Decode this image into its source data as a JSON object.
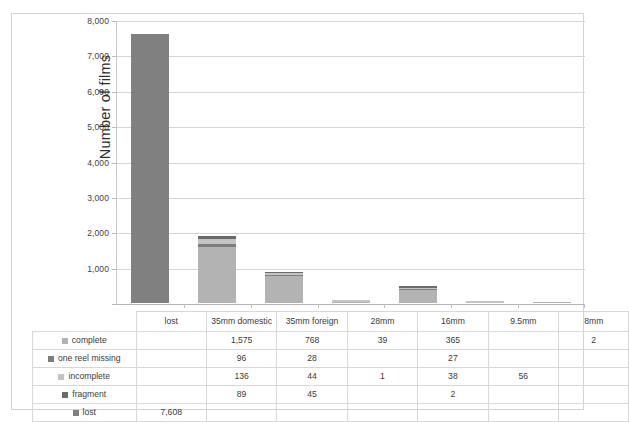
{
  "chart_data": {
    "type": "bar",
    "subtype": "stacked-column-with-data-table",
    "title": "",
    "xlabel": "",
    "ylabel": "Number of films",
    "ylim": [
      0,
      8000
    ],
    "ytick_labels": [
      "8,000",
      "7,000",
      "6,000",
      "5,000",
      "4,000",
      "3,000",
      "2,000",
      "1,000",
      ""
    ],
    "ytick_values": [
      8000,
      7000,
      6000,
      5000,
      4000,
      3000,
      2000,
      1000,
      0
    ],
    "grid": true,
    "legend_position": "data-table-row-headers",
    "categories": [
      "lost",
      "35mm domestic",
      "35mm foreign",
      "28mm",
      "16mm",
      "9.5mm",
      "8mm"
    ],
    "series": [
      {
        "name": "complete",
        "color": "#b3b3b3",
        "values": [
          null,
          1575,
          768,
          39,
          365,
          null,
          2
        ]
      },
      {
        "name": "one reel missing",
        "color": "#7d7d7d",
        "values": [
          null,
          96,
          28,
          null,
          27,
          null,
          null
        ]
      },
      {
        "name": "incomplete",
        "color": "#c4c4c4",
        "values": [
          null,
          136,
          44,
          1,
          38,
          56,
          null
        ]
      },
      {
        "name": "fragment",
        "color": "#6b6b6b",
        "values": [
          null,
          89,
          45,
          null,
          2,
          null,
          null
        ]
      },
      {
        "name": "lost",
        "color": "#808080",
        "values": [
          7608,
          null,
          null,
          null,
          null,
          null,
          null
        ]
      }
    ],
    "totals": [
      7608,
      1896,
      885,
      40,
      432,
      56,
      2
    ]
  },
  "table": {
    "corner_label": "",
    "column_headers": [
      "lost",
      "35mm domestic",
      "35mm foreign",
      "28mm",
      "16mm",
      "9.5mm",
      "8mm"
    ],
    "rows": [
      {
        "label": "complete",
        "swatch": "#b3b3b3",
        "cells": [
          "",
          "1,575",
          "768",
          "39",
          "365",
          "",
          "2"
        ]
      },
      {
        "label": "one reel missing",
        "swatch": "#7d7d7d",
        "cells": [
          "",
          "96",
          "28",
          "",
          "27",
          "",
          ""
        ]
      },
      {
        "label": "incomplete",
        "swatch": "#c4c4c4",
        "cells": [
          "",
          "136",
          "44",
          "1",
          "38",
          "56",
          ""
        ]
      },
      {
        "label": "fragment",
        "swatch": "#6b6b6b",
        "cells": [
          "",
          "89",
          "45",
          "",
          "2",
          "",
          ""
        ]
      },
      {
        "label": "lost",
        "swatch": "#808080",
        "cells": [
          "7,608",
          "",
          "",
          "",
          "",
          "",
          ""
        ]
      }
    ]
  },
  "colors": {
    "frame_border": "#d2d2d2",
    "gridline": "#d6d6d6",
    "axis": "#b4b4b4",
    "table_border": "#d8d8d8",
    "text": "#3b3b3b"
  }
}
